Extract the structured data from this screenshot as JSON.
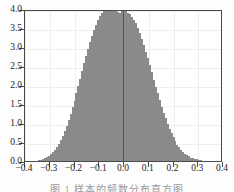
{
  "figure": {
    "caption_fragment": "图 1  样本的频数分布直方图"
  },
  "axes": {
    "y_ticklabels": [
      "0.0",
      "0.5",
      "1.0",
      "1.5",
      "2.0",
      "2.5",
      "3.0",
      "3.5",
      "4.0"
    ],
    "x_ticklabels": [
      "−0.4",
      "−0.3",
      "−0.2",
      "−0.1",
      "0.0",
      "0.1",
      "0.2",
      "0.3",
      "0.4"
    ]
  },
  "style": {
    "bar_fill": "#b2b2b2",
    "bar_edge": "#8a8a8a",
    "frame": "#4a4a4a",
    "grid": "#eeeeee",
    "background": "#ffffff"
  },
  "chart_data": {
    "type": "bar",
    "title": "",
    "subtitle": "",
    "xlabel": "",
    "ylabel": "",
    "xlim": [
      -0.4,
      0.4
    ],
    "ylim": [
      0.0,
      4.0
    ],
    "grid": true,
    "legend": "none",
    "xticks": [
      -0.4,
      -0.3,
      -0.2,
      -0.1,
      0.0,
      0.1,
      0.2,
      0.3,
      0.4
    ],
    "yticks": [
      0.0,
      0.5,
      1.0,
      1.5,
      2.0,
      2.5,
      3.0,
      3.5,
      4.0
    ],
    "bar_width": 0.008,
    "x": [
      -0.36,
      -0.352,
      -0.344,
      -0.336,
      -0.328,
      -0.32,
      -0.312,
      -0.304,
      -0.296,
      -0.288,
      -0.28,
      -0.272,
      -0.264,
      -0.256,
      -0.248,
      -0.24,
      -0.232,
      -0.224,
      -0.216,
      -0.208,
      -0.2,
      -0.192,
      -0.184,
      -0.176,
      -0.168,
      -0.16,
      -0.152,
      -0.144,
      -0.136,
      -0.128,
      -0.12,
      -0.112,
      -0.104,
      -0.096,
      -0.088,
      -0.08,
      -0.072,
      -0.064,
      -0.056,
      -0.048,
      -0.04,
      -0.032,
      -0.024,
      -0.016,
      -0.008,
      0.0,
      0.008,
      0.016,
      0.024,
      0.032,
      0.04,
      0.048,
      0.056,
      0.064,
      0.072,
      0.08,
      0.088,
      0.096,
      0.104,
      0.112,
      0.12,
      0.128,
      0.136,
      0.144,
      0.152,
      0.16,
      0.168,
      0.176,
      0.184,
      0.192,
      0.2,
      0.208,
      0.216,
      0.224,
      0.232,
      0.24,
      0.248,
      0.256,
      0.264,
      0.272,
      0.28,
      0.288,
      0.296,
      0.304,
      0.312,
      0.32
    ],
    "values": [
      0.0,
      0.0,
      0.02,
      0.03,
      0.05,
      0.07,
      0.1,
      0.14,
      0.18,
      0.24,
      0.3,
      0.38,
      0.46,
      0.56,
      0.67,
      0.8,
      0.93,
      1.08,
      1.24,
      1.41,
      1.59,
      1.78,
      1.97,
      2.17,
      2.37,
      2.57,
      2.76,
      2.95,
      3.13,
      3.3,
      3.45,
      3.59,
      3.71,
      3.81,
      3.89,
      3.94,
      3.97,
      3.99,
      4.0,
      3.99,
      3.97,
      3.95,
      3.92,
      3.9,
      3.95,
      3.98,
      3.94,
      3.9,
      3.86,
      3.8,
      3.72,
      3.62,
      3.5,
      3.36,
      3.21,
      3.05,
      2.88,
      2.7,
      2.52,
      2.33,
      2.14,
      1.96,
      1.78,
      1.6,
      1.43,
      1.27,
      1.12,
      0.98,
      0.85,
      0.73,
      0.62,
      0.52,
      0.43,
      0.36,
      0.29,
      0.24,
      0.19,
      0.15,
      0.12,
      0.09,
      0.07,
      0.05,
      0.04,
      0.03,
      0.02,
      0.0
    ]
  }
}
